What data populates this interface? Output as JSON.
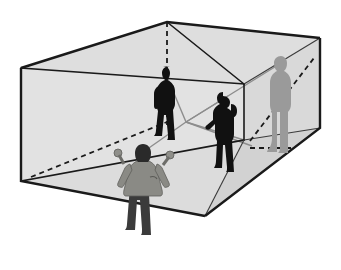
{
  "figure": {
    "title": "",
    "caption": "",
    "type": "perspective-line-illustration",
    "canvas": {
      "width": 341,
      "height": 270,
      "background": "#ffffff"
    }
  },
  "colors": {
    "background": "#ffffff",
    "outline": "#1a1a1a",
    "face_light": "#e3e3e3",
    "face_mid": "#d8d8d8",
    "face_dark": "#cfcfcf",
    "figure_black": "#111111",
    "figure_gray": "#9a9a9a",
    "figure_coat": "#8a8a85",
    "figure_pants": "#3b3b3b",
    "sightline_gray": "#8d8d8d",
    "hidden_edge": "#1a1a1a"
  },
  "geometry": {
    "box_label": "outer transparent box",
    "vertices": {
      "top_left": [
        21,
        68
      ],
      "top_apex": [
        167,
        22
      ],
      "top_right": [
        320,
        38
      ],
      "top_inner_right": [
        244,
        84
      ],
      "bottom_left": [
        21,
        181
      ],
      "bottom_front": [
        205,
        216
      ],
      "bottom_right": [
        320,
        128
      ],
      "bottom_inner_right": [
        244,
        140
      ]
    },
    "eye_node": [
      186,
      122
    ],
    "dashed_vertical": {
      "from": [
        167,
        22
      ],
      "to": [
        167,
        125
      ]
    },
    "dashed_diagonal_left": {
      "from": [
        33,
        176
      ],
      "to": [
        167,
        122
      ]
    },
    "dashed_diagonal_right": {
      "from": [
        248,
        140
      ],
      "to": [
        312,
        60
      ]
    },
    "dashed_horizontal_right": {
      "from": [
        248,
        147
      ],
      "to": [
        288,
        147
      ]
    }
  },
  "figures": [
    {
      "id": "figure-foreground-observer",
      "name": "foreground observer with raised arms",
      "position": [
        128,
        152
      ],
      "height_px": 78,
      "color_coat": "#8a8a85",
      "color_pants": "#3b3b3b",
      "color_hair": "#2a2a2a",
      "pose": "arms raised outward, back to viewer",
      "shading": "gray"
    },
    {
      "id": "figure-back-left-silhouette",
      "name": "back-left dark silhouette on rear wall",
      "position": [
        168,
        70
      ],
      "height_px": 60,
      "color": "#111111",
      "pose": "standing, facing left",
      "shading": "black"
    },
    {
      "id": "figure-middle-silhouette",
      "name": "middle dark silhouette with hand on hip",
      "position": [
        222,
        92
      ],
      "height_px": 62,
      "color": "#111111",
      "pose": "standing, hand on hip",
      "shading": "black"
    },
    {
      "id": "figure-right-gray-silhouette",
      "name": "right gray silhouette in profile",
      "position": [
        280,
        55
      ],
      "height_px": 92,
      "color": "#9a9a9a",
      "pose": "standing in profile facing left",
      "shading": "light gray"
    }
  ],
  "sightlines": {
    "count": 5,
    "origin": [
      186,
      122
    ],
    "description": "gray rays from the observer eye node to the figures and box corners"
  },
  "labels": {
    "items": []
  }
}
